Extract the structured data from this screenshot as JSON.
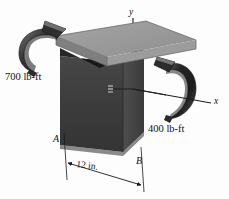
{
  "figure": {
    "background_color": "#fdfdfd",
    "width": 229,
    "height": 199
  },
  "labels": {
    "moment_left": "700 lb-ft",
    "moment_right": "400 lb-ft",
    "axis_y": "y",
    "axis_x": "x",
    "point_a": "A",
    "point_b": "B",
    "dimension": "12 in."
  },
  "colors": {
    "plate_top": "#9a9a9a",
    "plate_front": "#8a8a8a",
    "plate_side": "#6f6f6f",
    "block_front": "#3d3d3d",
    "block_side": "#4a4a4a",
    "block_shadow": "#1d1d1d",
    "ribbon_dark": "#262626",
    "ribbon_mid": "#565656",
    "ribbon_light": "#8d8d8d",
    "line": "#1a1a1a",
    "text": "#111111"
  },
  "elements": {
    "plate_label": "top plate",
    "block_label": "vertical block",
    "ribbon_left_label": "counterclockwise couple arrow 700 lb-ft",
    "ribbon_right_label": "couple arrow 400 lb-ft",
    "axis_y_label": "vertical y axis",
    "axis_x_label": "horizontal x axis",
    "dimension_label": "12 in. width dimension"
  }
}
